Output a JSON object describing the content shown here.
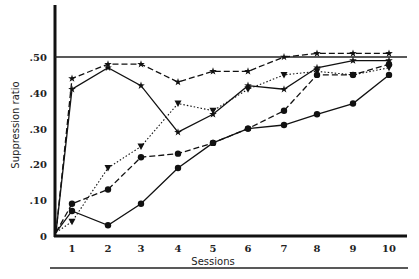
{
  "chart_data": {
    "type": "line",
    "title": "",
    "xlabel": "Sessions",
    "ylabel": "Suppression ratio",
    "x": [
      1,
      2,
      3,
      4,
      5,
      6,
      7,
      8,
      9,
      10
    ],
    "x_tick_labels": [
      "1",
      "2",
      "3",
      "4",
      "5",
      "6",
      "7",
      "8",
      "9",
      "10"
    ],
    "y_tick_labels": [
      "0",
      ".10",
      ".20",
      ".30",
      ".40",
      ".50"
    ],
    "y_ticks": [
      0,
      0.1,
      0.2,
      0.3,
      0.4,
      0.5
    ],
    "ylim": [
      0,
      0.65
    ],
    "reference_line": 0.5,
    "grid": false,
    "legend": null,
    "series": [
      {
        "name": "dashed-star",
        "line": "dashed",
        "marker": "star",
        "origin": 0.01,
        "values": [
          0.44,
          0.48,
          0.48,
          0.43,
          0.46,
          0.46,
          0.5,
          0.51,
          0.51,
          0.51
        ]
      },
      {
        "name": "solid-star",
        "line": "solid",
        "marker": "star",
        "origin": 0.01,
        "values": [
          0.41,
          0.47,
          0.42,
          0.29,
          0.34,
          0.42,
          0.41,
          0.47,
          0.49,
          0.49
        ]
      },
      {
        "name": "dotted-triangle",
        "line": "dotted",
        "marker": "triangle",
        "origin": 0.01,
        "values": [
          0.04,
          0.19,
          0.25,
          0.37,
          0.35,
          0.41,
          0.45,
          0.46,
          0.45,
          0.47
        ]
      },
      {
        "name": "dashed-circle",
        "line": "dashed",
        "marker": "circle",
        "origin": 0.01,
        "values": [
          0.09,
          0.13,
          0.22,
          0.23,
          0.26,
          0.3,
          0.35,
          0.45,
          0.45,
          0.48
        ]
      },
      {
        "name": "solid-circle",
        "line": "solid",
        "marker": "circle",
        "origin": 0.01,
        "values": [
          0.07,
          0.03,
          0.09,
          0.19,
          0.26,
          0.3,
          0.31,
          0.34,
          0.37,
          0.45
        ]
      }
    ]
  }
}
